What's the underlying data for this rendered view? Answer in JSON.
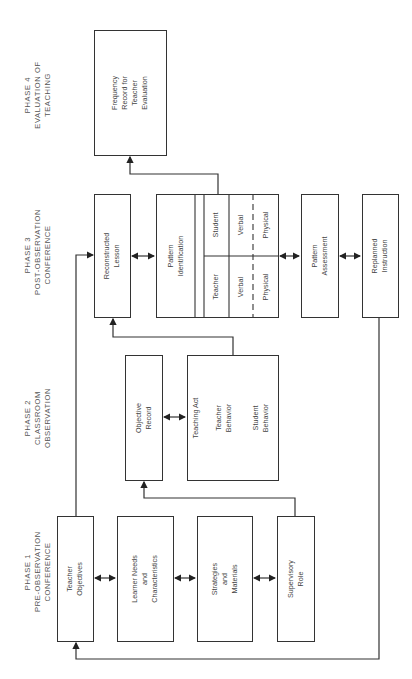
{
  "phases": [
    {
      "line1": "PHASE 1",
      "line2": "PRE-OBSERVATION",
      "line3": "CONFERENCE"
    },
    {
      "line1": "PHASE 2",
      "line2": "CLASSROOM",
      "line3": "OBSERVATION"
    },
    {
      "line1": "PHASE 3",
      "line2": "POST-OBSERVATION",
      "line3": "CONFERENCE"
    },
    {
      "line1": "PHASE 4",
      "line2": "EVALUATION OF",
      "line3": "TEACHING"
    }
  ],
  "phase1": {
    "teacher_objectives": [
      "Teacher",
      "Objectives"
    ],
    "learner_needs": [
      "Learner Needs",
      "and",
      "Characteristics"
    ],
    "strategies": [
      "Strategies",
      "and",
      "Materials"
    ],
    "supervisory_role": [
      "Supervisory",
      "Role"
    ]
  },
  "phase2": {
    "objective_record": [
      "Objective",
      "Record"
    ],
    "teaching_act": "Teaching Act",
    "teacher_behavior": [
      "Teacher",
      "Behavior"
    ],
    "student_behavior": [
      "Student",
      "Behavior"
    ]
  },
  "phase3": {
    "reconstructed_lesson": [
      "Reconstructed",
      "Lesson"
    ],
    "pattern_identification": [
      "Pattern",
      "Identification"
    ],
    "grid": {
      "student": "Student",
      "teacher": "Teacher",
      "verbal": "Verbal",
      "physical": "Physical"
    },
    "pattern_assessment": [
      "Pattern",
      "Assessment"
    ],
    "replanned_instruction": [
      "Replanned",
      "Instruction"
    ]
  },
  "phase4": {
    "frequency_record": [
      "Frequency",
      "Record for",
      "Teacher",
      "Evaluation"
    ]
  }
}
